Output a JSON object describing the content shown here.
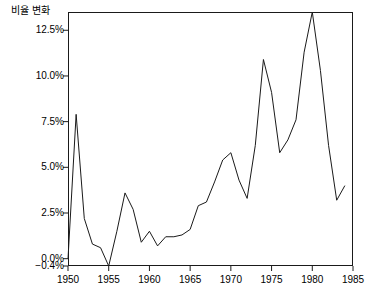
{
  "chart_data": {
    "type": "line",
    "title": "",
    "subtitle": "",
    "xlabel": "",
    "ylabel": "비율 변화",
    "xlim": [
      1950,
      1985
    ],
    "ylim": [
      -0.4,
      13.5
    ],
    "grid": false,
    "legend": null,
    "x_ticks": [
      1950,
      1955,
      1960,
      1965,
      1970,
      1975,
      1980,
      1985
    ],
    "x_tick_labels": [
      "1950",
      "1955",
      "1960",
      "1965",
      "1970",
      "1975",
      "1980",
      "1985"
    ],
    "y_ticks": [
      -0.4,
      0.0,
      2.5,
      5.0,
      7.5,
      10.0,
      12.5
    ],
    "y_tick_labels": [
      "−0.4%",
      "0.0%",
      "2.5%",
      "5.0%",
      "7.5%",
      "10.0%",
      "12.5%"
    ],
    "line_color": "#1a1a1a",
    "line_width": 1,
    "x": [
      1950,
      1951,
      1952,
      1953,
      1954,
      1955,
      1956,
      1957,
      1958,
      1959,
      1960,
      1961,
      1962,
      1963,
      1964,
      1965,
      1966,
      1967,
      1968,
      1969,
      1970,
      1971,
      1972,
      1973,
      1974,
      1975,
      1976,
      1977,
      1978,
      1979,
      1980,
      1981,
      1982,
      1983,
      1984
    ],
    "values": [
      0.0,
      7.9,
      2.2,
      0.8,
      0.6,
      -0.4,
      1.5,
      3.6,
      2.7,
      0.9,
      1.5,
      0.7,
      1.2,
      1.2,
      1.3,
      1.6,
      2.9,
      3.1,
      4.2,
      5.4,
      5.8,
      4.3,
      3.3,
      6.2,
      10.9,
      9.1,
      5.8,
      6.5,
      7.6,
      11.3,
      13.5,
      10.3,
      6.2,
      3.2,
      4.0
    ],
    "series": [
      {
        "name": "비율 변화",
        "values": [
          0.0,
          7.9,
          2.2,
          0.8,
          0.6,
          -0.4,
          1.5,
          3.6,
          2.7,
          0.9,
          1.5,
          0.7,
          1.2,
          1.2,
          1.3,
          1.6,
          2.9,
          3.1,
          4.2,
          5.4,
          5.8,
          4.3,
          3.3,
          6.2,
          10.9,
          9.1,
          5.8,
          6.5,
          7.6,
          11.3,
          13.5,
          10.3,
          6.2,
          3.2,
          4.0
        ]
      }
    ]
  }
}
